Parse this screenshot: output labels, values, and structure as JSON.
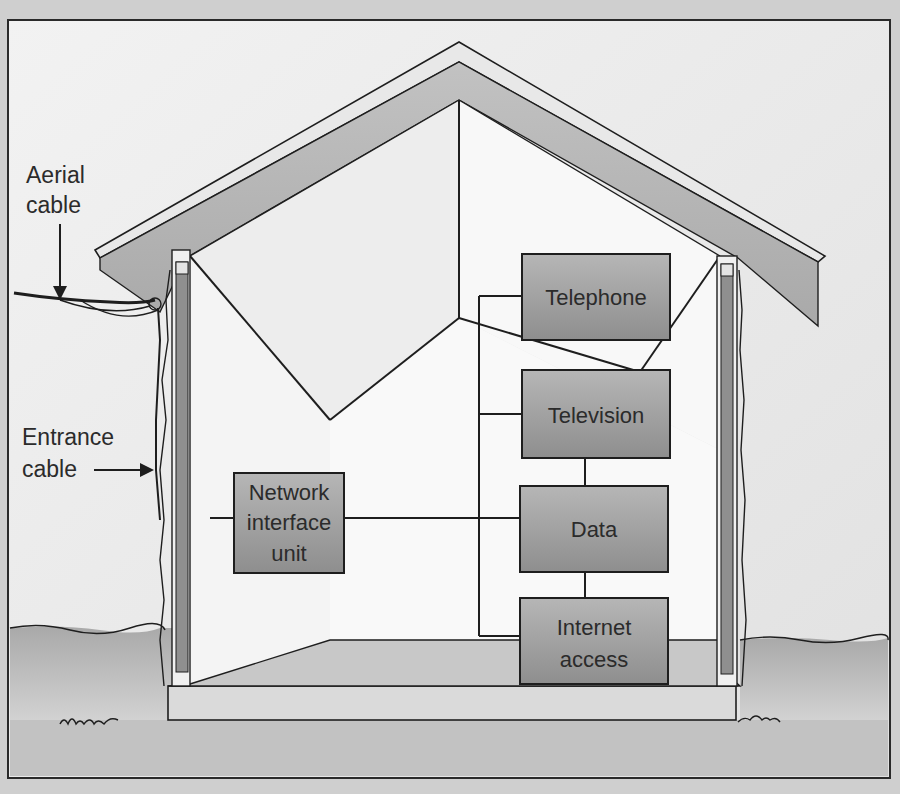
{
  "diagram": {
    "callouts": {
      "aerial_cable": [
        "Aerial",
        "cable"
      ],
      "entrance_cable": [
        "Entrance",
        "cable"
      ]
    },
    "nodes": {
      "network_interface_unit": [
        "Network",
        "interface",
        "unit"
      ],
      "telephone": [
        "Telephone"
      ],
      "television": [
        "Television"
      ],
      "data": [
        "Data"
      ],
      "internet_access": [
        "Internet",
        "access"
      ]
    },
    "colors": {
      "frame_border": "#2a2a2a",
      "page_background": "#ececec",
      "roof_fill": "#b8b8b8",
      "roof_trim": "#e4e4e4",
      "wall_stud": "#8f8f8f",
      "interior_wall_left": "#f3f3f3",
      "interior_wall_back": "#f7f7f7",
      "interior_wall_right": "#fbfbfb",
      "floor": "#c9c9c9",
      "foundation": "#d9d9d9",
      "ground": "#bdbdbd",
      "box_fill_top": "#b4b4b4",
      "box_fill_bottom": "#8e8e8e",
      "line": "#1e1e1e",
      "text": "#2b2b2b"
    }
  }
}
